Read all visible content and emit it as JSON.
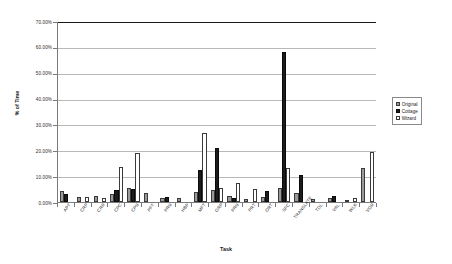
{
  "chart_data": {
    "type": "bar",
    "title": "",
    "xlabel": "Task",
    "ylabel": "% of Time",
    "ylim": [
      0,
      70
    ],
    "ytick_labels": [
      "0.00%",
      "10.00%",
      "20.00%",
      "30.00%",
      "40.00%",
      "50.00%",
      "60.00%",
      "70.00%"
    ],
    "ytick_values": [
      0,
      10,
      20,
      30,
      40,
      50,
      60,
      70
    ],
    "grid": true,
    "legend_position": "right",
    "categories": [
      "APT",
      "CRP",
      "CRR",
      "CPC",
      "CPN",
      "PFT",
      "PRN",
      "HBP",
      "MFT",
      "ORP",
      "PRN",
      "PRT",
      "ORT",
      "SFC",
      "TRANSLATE",
      "TDL",
      "VAL",
      "WLK",
      "VOR"
    ],
    "series": [
      {
        "name": "Original",
        "color": "#9a9a9a",
        "values": [
          4.2,
          1.8,
          2.3,
          3.1,
          5.6,
          3.4,
          1.6,
          1.5,
          4.0,
          4.6,
          2.2,
          1.2,
          2.1,
          5.4,
          3.5,
          1.0,
          1.4,
          0.9,
          13.2
        ]
      },
      {
        "name": "Cottage",
        "color": "#1c1c1c",
        "values": [
          3.0,
          0.0,
          0.0,
          4.8,
          5.2,
          0.0,
          2.0,
          0.0,
          12.4,
          20.8,
          1.4,
          0.0,
          4.2,
          58.0,
          10.5,
          0.0,
          2.4,
          0.0,
          0.0
        ]
      },
      {
        "name": "Wizard",
        "color": "#ffffff",
        "values": [
          0.0,
          1.9,
          1.7,
          13.6,
          18.9,
          0.0,
          0.0,
          0.0,
          26.6,
          5.6,
          7.3,
          5.2,
          0.0,
          13.0,
          0.0,
          0.0,
          0.0,
          1.5,
          19.4
        ]
      }
    ]
  },
  "legend": {
    "items": [
      {
        "label": "Original",
        "key": "original"
      },
      {
        "label": "Cottage",
        "key": "cottage"
      },
      {
        "label": "Wizard",
        "key": "wizard"
      }
    ]
  }
}
